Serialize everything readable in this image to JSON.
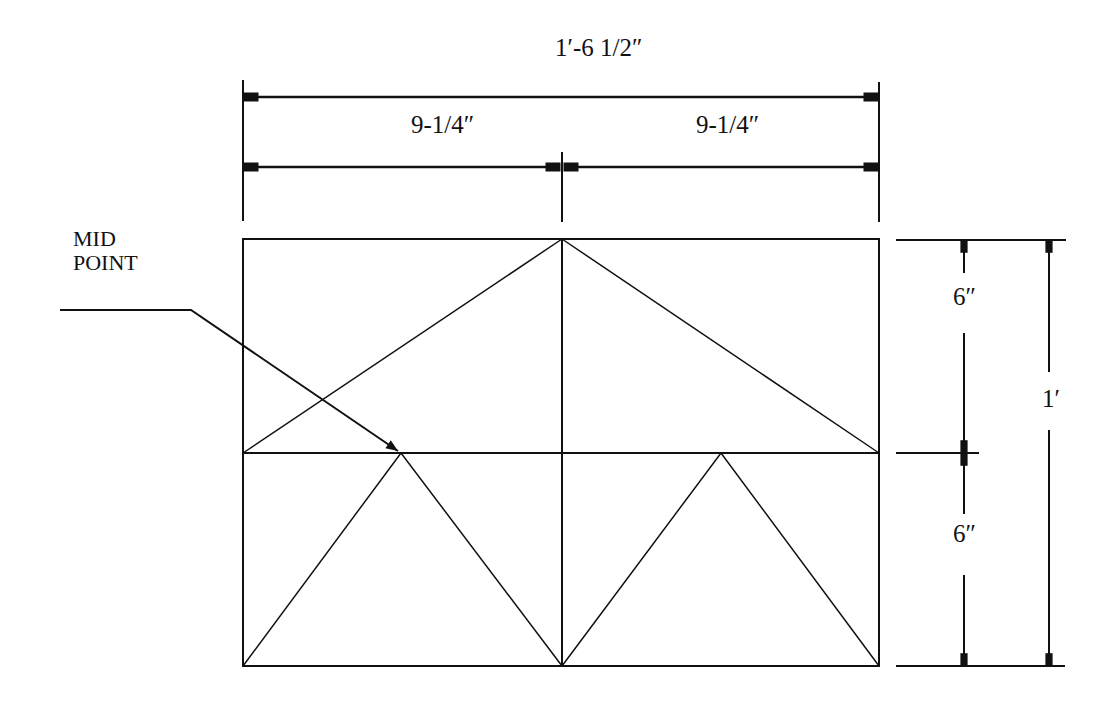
{
  "drawing": {
    "type": "dimensioned panel frame elevation",
    "line_color": "#111111",
    "background": "#ffffff"
  },
  "dimensions": {
    "overall_width": "1′-6 1/2″",
    "left_half_width": "9-1/4″",
    "right_half_width": "9-1/4″",
    "upper_height": "6″",
    "lower_height": "6″",
    "overall_height": "1′"
  },
  "annotations": {
    "midpoint_line1": "MID",
    "midpoint_line2": "POINT"
  }
}
